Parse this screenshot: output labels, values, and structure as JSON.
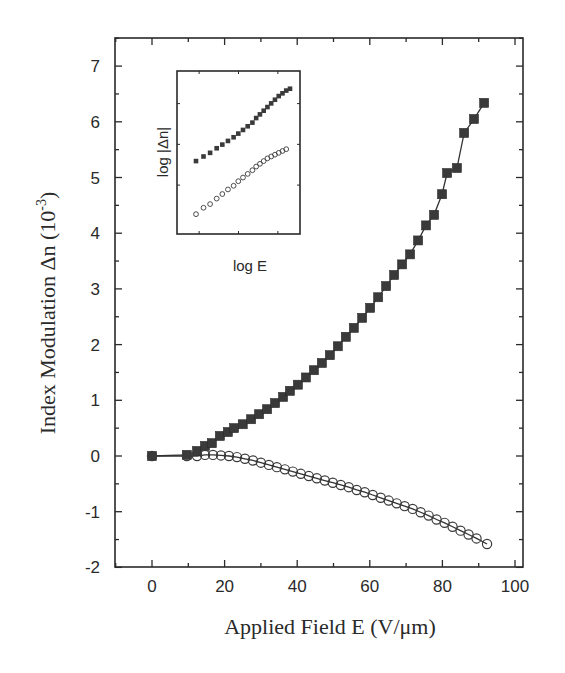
{
  "chart_data": {
    "type": "line",
    "title": "",
    "xlabel": "Applied Field  E (V/μm)",
    "ylabel": "Index Modulation  Δn  (10⁻³)",
    "xlim": [
      -10,
      100
    ],
    "ylim": [
      -2,
      7.5
    ],
    "x_ticks": [
      0,
      20,
      40,
      60,
      80,
      100
    ],
    "y_ticks": [
      -2,
      -1,
      0,
      1,
      2,
      3,
      4,
      5,
      6,
      7
    ],
    "x_tick_labels": [
      "0",
      "20",
      "40",
      "60",
      "80",
      "100"
    ],
    "y_tick_labels": [
      "-2",
      "-1",
      "0",
      "1",
      "2",
      "3",
      "4",
      "5",
      "6",
      "7"
    ],
    "grid": false,
    "legend": null,
    "series": [
      {
        "name": "filled squares",
        "marker": "square-filled",
        "x": [
          0,
          9.6,
          12.4,
          14.6,
          16.5,
          18.7,
          20.9,
          22.6,
          25.0,
          27.3,
          29.5,
          31.7,
          33.9,
          36.1,
          38.0,
          40.2,
          42.4,
          44.6,
          46.8,
          49.0,
          51.2,
          53.4,
          55.6,
          57.9,
          60.1,
          62.3,
          64.5,
          66.7,
          68.9,
          71.1,
          73.3,
          75.5,
          77.7,
          79.9,
          81.3,
          84.0,
          86.0,
          88.7,
          91.5
        ],
        "y": [
          0.0,
          0.02,
          0.09,
          0.18,
          0.23,
          0.36,
          0.43,
          0.5,
          0.57,
          0.66,
          0.75,
          0.84,
          0.95,
          1.06,
          1.17,
          1.28,
          1.41,
          1.54,
          1.67,
          1.81,
          1.97,
          2.14,
          2.3,
          2.48,
          2.66,
          2.85,
          3.05,
          3.25,
          3.44,
          3.62,
          3.87,
          4.14,
          4.33,
          4.7,
          5.08,
          5.17,
          5.8,
          6.05,
          6.34
        ]
      },
      {
        "name": "open circles",
        "marker": "circle-open",
        "x": [
          0,
          9.6,
          12.4,
          14.6,
          16.8,
          19.0,
          21.2,
          23.4,
          25.6,
          27.8,
          30.0,
          32.2,
          34.4,
          36.6,
          38.8,
          41.0,
          43.2,
          45.4,
          47.6,
          49.8,
          52.0,
          54.2,
          56.4,
          58.6,
          60.8,
          63.0,
          65.2,
          67.4,
          69.6,
          71.8,
          74.0,
          76.2,
          78.4,
          80.6,
          82.8,
          85.0,
          87.2,
          89.4,
          92.3
        ],
        "y": [
          0.0,
          0.0,
          0.0,
          0.02,
          0.02,
          0.01,
          0.0,
          -0.02,
          -0.05,
          -0.08,
          -0.12,
          -0.16,
          -0.2,
          -0.24,
          -0.28,
          -0.32,
          -0.36,
          -0.4,
          -0.44,
          -0.48,
          -0.52,
          -0.56,
          -0.61,
          -0.65,
          -0.7,
          -0.75,
          -0.8,
          -0.85,
          -0.9,
          -0.95,
          -1.01,
          -1.07,
          -1.14,
          -1.2,
          -1.27,
          -1.34,
          -1.41,
          -1.48,
          -1.58
        ]
      }
    ],
    "inset": {
      "xlabel": "log E",
      "ylabel": "log |Δn|",
      "series": [
        {
          "name": "filled squares (log-log)",
          "marker": "square-filled",
          "points": [
            [
              0.0,
              0.0
            ],
            [
              0.08,
              0.05
            ],
            [
              0.15,
              0.09
            ],
            [
              0.22,
              0.14
            ],
            [
              0.28,
              0.18
            ],
            [
              0.34,
              0.22
            ],
            [
              0.4,
              0.26
            ],
            [
              0.45,
              0.3
            ],
            [
              0.5,
              0.34
            ],
            [
              0.55,
              0.38
            ],
            [
              0.6,
              0.42
            ],
            [
              0.64,
              0.47
            ],
            [
              0.68,
              0.51
            ],
            [
              0.72,
              0.55
            ],
            [
              0.76,
              0.59
            ],
            [
              0.8,
              0.63
            ],
            [
              0.84,
              0.67
            ],
            [
              0.88,
              0.71
            ],
            [
              0.92,
              0.74
            ],
            [
              0.96,
              0.77
            ],
            [
              1.0,
              0.79
            ]
          ]
        },
        {
          "name": "open circles (log-log)",
          "marker": "circle-open",
          "points": [
            [
              0.0,
              -0.58
            ],
            [
              0.08,
              -0.51
            ],
            [
              0.15,
              -0.47
            ],
            [
              0.22,
              -0.41
            ],
            [
              0.28,
              -0.36
            ],
            [
              0.34,
              -0.31
            ],
            [
              0.4,
              -0.27
            ],
            [
              0.45,
              -0.22
            ],
            [
              0.5,
              -0.18
            ],
            [
              0.55,
              -0.14
            ],
            [
              0.6,
              -0.1
            ],
            [
              0.64,
              -0.06
            ],
            [
              0.68,
              -0.03
            ],
            [
              0.72,
              0.0
            ],
            [
              0.76,
              0.03
            ],
            [
              0.8,
              0.05
            ],
            [
              0.84,
              0.07
            ],
            [
              0.88,
              0.09
            ],
            [
              0.92,
              0.11
            ],
            [
              0.96,
              0.13
            ]
          ]
        }
      ]
    }
  },
  "labels": {
    "xlabel": "Applied Field  E (V/μm)",
    "ylabel_main": "Index Modulation  Δn  (10",
    "ylabel_sup": "-3",
    "ylabel_close": ")",
    "inset_xlabel": "log E",
    "inset_ylabel": "log |Δn|"
  },
  "colors": {
    "axis": "#2a2a2a",
    "marker_fill": "#3a3a3a",
    "line": "#333333",
    "background": "#ffffff"
  }
}
